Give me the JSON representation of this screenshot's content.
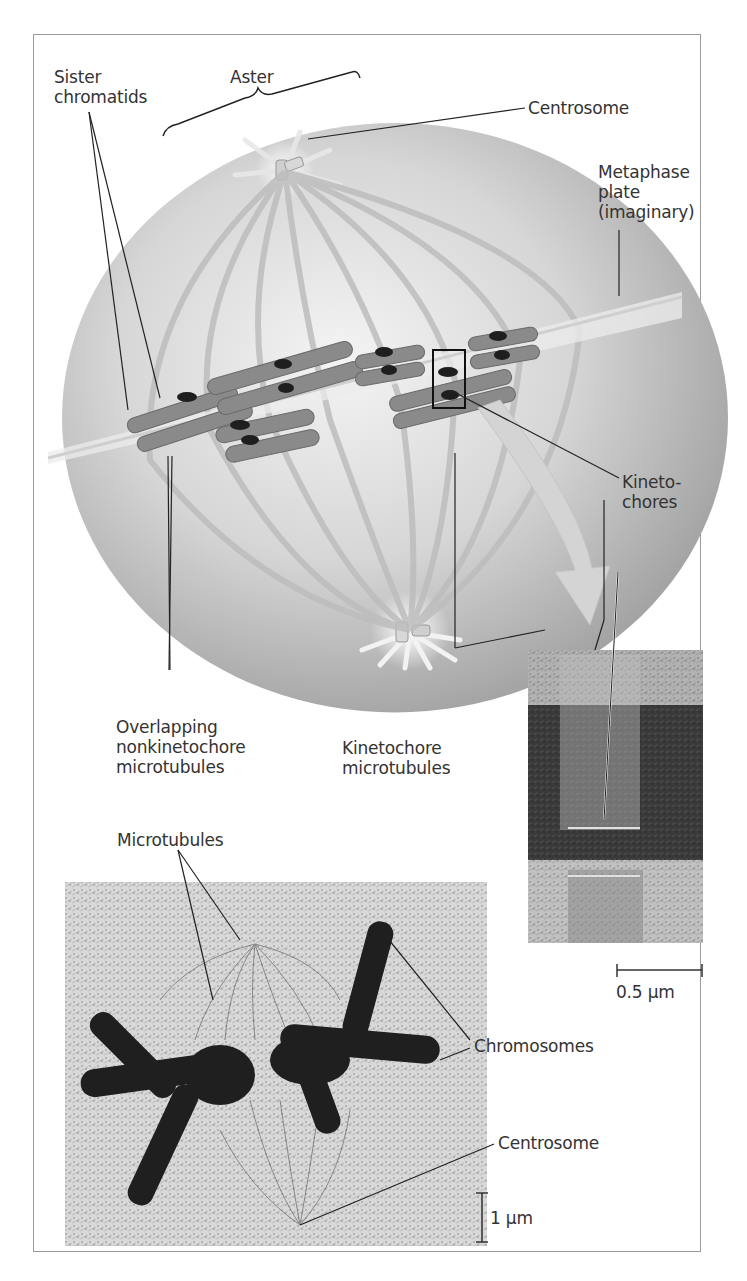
{
  "figure": {
    "diagram_labels": {
      "sister_chromatids": "Sister\nchromatids",
      "aster": "Aster",
      "centrosome_top": "Centrosome",
      "metaphase_plate": "Metaphase\nplate\n(imaginary)",
      "kinetochores": "Kineto-\nchores",
      "overlapping_nonkinetochore": "Overlapping\nnonkinetochore\nmicrotubules",
      "kinetochore_microtubules": "Kinetochore\nmicrotubules"
    },
    "micrograph_labels": {
      "microtubules": "Microtubules",
      "chromosomes": "Chromosomes",
      "centrosome_bottom": "Centrosome"
    },
    "scale_bars": {
      "tem_scale": "0.5 µm",
      "lm_scale": "1 µm"
    },
    "colors": {
      "sphere_light": "#f2f2f2",
      "sphere_dark": "#a8a8a8",
      "chromosome": "#7a7a7a",
      "kinetochore": "#1e1e1e",
      "frame_border": "#9a9a9a",
      "arrow": "#d8d8d8"
    }
  }
}
